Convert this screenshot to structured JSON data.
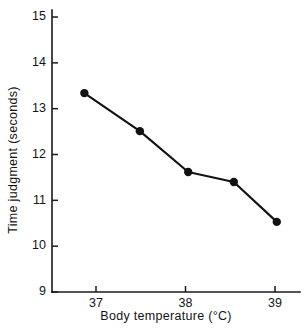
{
  "figure": {
    "width": 305,
    "height": 328,
    "background": "#ffffff",
    "ink_color": "#121212"
  },
  "chart_data": {
    "type": "line",
    "title": "",
    "subtitle": "",
    "xlabel": "Body temperature (°C)",
    "ylabel": "Time judgment (seconds)",
    "xlim": [
      36.5,
      39.2
    ],
    "ylim": [
      9,
      15
    ],
    "xticks": [
      37,
      38,
      39
    ],
    "xtick_labels": [
      "37",
      "38",
      "39"
    ],
    "yticks": [
      9,
      10,
      11,
      12,
      13,
      14,
      15
    ],
    "ytick_labels": [
      "9",
      "10",
      "11",
      "12",
      "13",
      "14",
      "15"
    ],
    "grid": false,
    "legend": false,
    "legend_position": "none",
    "marker": "filled-circle",
    "x": [
      36.87,
      37.49,
      38.03,
      38.54,
      39.02
    ],
    "values": [
      13.34,
      12.51,
      11.62,
      11.4,
      10.53
    ],
    "series": [
      {
        "name": "Time judgment",
        "x": [
          36.87,
          37.49,
          38.03,
          38.54,
          39.02
        ],
        "values": [
          13.34,
          12.51,
          11.62,
          11.4,
          10.53
        ]
      }
    ],
    "annotations": []
  },
  "geometry": {
    "axis_x_px": 52,
    "axis_y_bottom_px": 292,
    "axis_y_top_px": 10,
    "axis_x_right_px": 300,
    "tick_len_px": 6,
    "x_pixel_at_37": 96,
    "x_pixels_per_degree": 89.5,
    "y_pixel_at_9": 292,
    "y_pixels_per_unit": 45.83,
    "marker_radius_px": 4.2
  }
}
